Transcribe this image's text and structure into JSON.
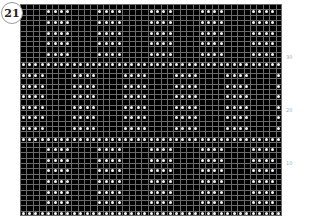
{
  "badge": {
    "number": "21"
  },
  "chart_data": {
    "type": "table",
    "columns": 41,
    "rows": 40,
    "colors": {
      "background": "#000000",
      "grid": "#6a6a6a",
      "stitch": "#f4f4f4"
    },
    "pattern_period": 8,
    "block_width": 4,
    "dot_rows_top_to_bottom": [
      "A",
      "A",
      "A",
      "A",
      "A",
      "F",
      "B",
      "B",
      "B",
      "B",
      "B",
      "B",
      "F",
      "A",
      "A",
      "A",
      "A",
      "A",
      "A",
      "F"
    ],
    "pattern_legend": {
      "A": "blocks starting col 4",
      "B": "blocks starting col 0",
      "F": "full row"
    },
    "row_labels": [
      {
        "label": "30",
        "row_from_bottom": 30
      },
      {
        "label": "20",
        "row_from_bottom": 20
      },
      {
        "label": "10",
        "row_from_bottom": 10
      }
    ]
  }
}
